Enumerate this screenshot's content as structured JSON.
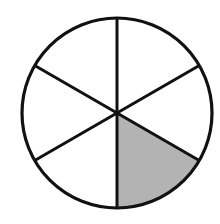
{
  "figure": {
    "total_parts": 6,
    "shaded_parts": 1,
    "fraction": "1/6",
    "center": [
      117,
      113
    ],
    "radius": 95,
    "spoke_angles_deg": [
      90,
      30,
      -30,
      -90,
      -150,
      150
    ],
    "shaded_sector_deg": [
      -90,
      -30
    ],
    "colors": {
      "stroke": "#111111",
      "shade": "#b3b3b3",
      "background": "#ffffff"
    }
  }
}
